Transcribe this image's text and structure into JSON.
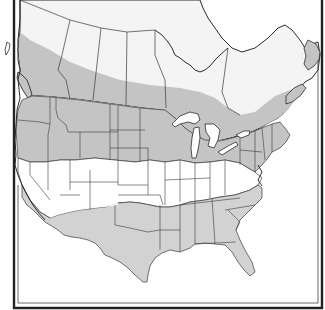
{
  "map": {
    "type": "range map",
    "region": "North America (Canada and contiguous United States)",
    "colors": {
      "background": "#ffffff",
      "range_shade": "#c9c9c9",
      "range_shade_dark": "#b9b9b9",
      "unshaded_land": "#ffffff",
      "canada_unshaded": "#f4f4f4",
      "border_line": "#3a3a3a",
      "frame": "#222222"
    },
    "shaded_regions": [
      "southern Canada band (British Columbia to Nova Scotia/Newfoundland)",
      "northern United States (Washington to Maine)",
      "southern United States (southern California through Texas to Florida and the Carolinas)"
    ],
    "unshaded_regions": [
      "northern Canada",
      "central United States"
    ]
  }
}
